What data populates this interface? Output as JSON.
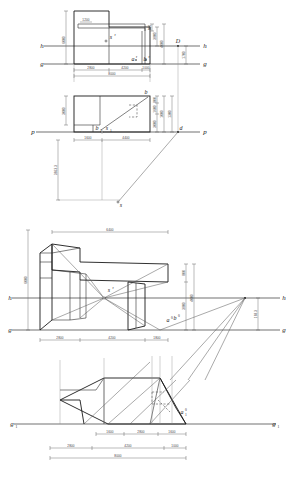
{
  "sheet": {
    "title": "Perspective construction of a stepped building block",
    "width": 290,
    "height": 480,
    "background": "#ffffff",
    "line_color": "#1a1a1a",
    "dim_color": "#3a3a3a",
    "ray_color": "#555555"
  },
  "views": {
    "plan": {
      "name": "top-plan-view",
      "axis_labels": {
        "h_left": "h",
        "h_right": "h",
        "g_left": "g",
        "g_right": "g"
      },
      "point_labels": {
        "station": "s",
        "station_sup": "r",
        "a_prime": "a",
        "a_sup": "r",
        "b_prime": "b",
        "b_sup": "r",
        "distance_point": "D"
      },
      "dims_horizontal": [
        "2800",
        "4200",
        "1000"
      ],
      "dim_total": "8000",
      "dims_vertical_left": [
        "6000"
      ],
      "dims_vertical_right": [
        "800",
        "4000",
        "3800"
      ],
      "dim_notch": "1200",
      "dim_D_drop": "1700"
    },
    "elevation": {
      "name": "side-elevation-view",
      "axis_labels": {
        "p_left": "p",
        "p_right": "p"
      },
      "point_labels": {
        "b": "b",
        "b1": "b",
        "b1_sub": "1",
        "s1": "s",
        "s1_sub": "1",
        "d": "d",
        "s_bottom": "s"
      },
      "dims_horizontal": [
        "1600",
        "4400"
      ],
      "dims_vertical_left": [
        "3000"
      ],
      "dims_vertical_right": [
        "800",
        "1600",
        "3000",
        "1000",
        "1300"
      ],
      "dim_depth": "3663.3"
    },
    "perspective": {
      "name": "perspective-view",
      "axis_labels": {
        "h_left": "h",
        "h_right": "h",
        "g_left": "g",
        "g_right": "g"
      },
      "point_labels": {
        "station": "s",
        "station_sup": "r",
        "a0": "a",
        "a0_sup": "0",
        "b0": "b",
        "b0_sup": "0"
      },
      "dim_top": "6400",
      "dims_vertical_left": [
        "6000"
      ],
      "dims_vertical_right": [
        "800",
        "4000",
        "3800",
        "168.3"
      ],
      "dims_horizontal": [
        "2800",
        "4200",
        "1800"
      ]
    },
    "ground_plan": {
      "name": "ground-plan-view",
      "axis_labels": {
        "g1_left": "g",
        "g1_left_sub": "1",
        "g1_right": "g",
        "g1_right_sub": "1"
      },
      "point_labels": {
        "a0": "a",
        "a0_sup": "0",
        "a0_sub": "1"
      },
      "dims_chain_upper": [
        "1600",
        "2800",
        "1600"
      ],
      "dims_chain_middle": [
        "2800",
        "4200",
        "1000"
      ],
      "dim_total": "8000"
    }
  }
}
